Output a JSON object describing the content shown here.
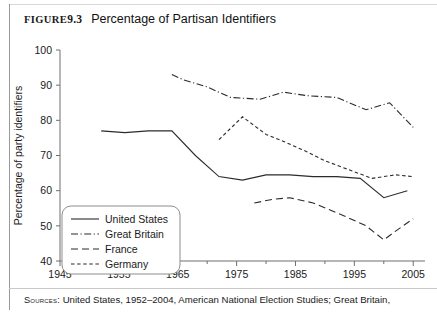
{
  "figure": {
    "label": "Figure",
    "number": "9.3",
    "caption": "Percentage of Partisan Identifiers"
  },
  "source": {
    "keyword": "Sources:",
    "text": "United States, 1952–2004, American National Election Studies; Great Britain,"
  },
  "chart_data": {
    "type": "line",
    "title": "Percentage of Partisan Identifiers",
    "xlabel": "",
    "ylabel": "Percentage of party identifiers",
    "xlim": [
      1945,
      2007
    ],
    "ylim": [
      40,
      100
    ],
    "xticks": [
      1945,
      1955,
      1965,
      1975,
      1985,
      1995,
      2005
    ],
    "xtick_labels": [
      "1945",
      "1955",
      "1965",
      "1975",
      "1985",
      "1995",
      "2005"
    ],
    "minor_xticks": [
      1950,
      1960,
      1970,
      1980,
      1990,
      2000
    ],
    "yticks": [
      40,
      50,
      60,
      70,
      80,
      90,
      100
    ],
    "ytick_labels": [
      "40",
      "50",
      "60",
      "70",
      "80",
      "90",
      "100"
    ],
    "grid": false,
    "legend_position": "lower-left",
    "series": [
      {
        "name": "United States",
        "dash": "none",
        "x": [
          1952,
          1956,
          1960,
          1964,
          1968,
          1972,
          1976,
          1980,
          1984,
          1988,
          1992,
          1996,
          2000,
          2004
        ],
        "y": [
          77.0,
          76.5,
          77.0,
          77.0,
          70.0,
          64.0,
          63.0,
          64.5,
          64.5,
          64.0,
          64.0,
          63.5,
          58.0,
          60.0
        ]
      },
      {
        "name": "Great Britain",
        "dash": "dashdot",
        "x": [
          1964,
          1966,
          1970,
          1974,
          1979,
          1983,
          1987,
          1992,
          1997,
          2001,
          2005
        ],
        "y": [
          93.0,
          91.5,
          89.5,
          86.5,
          86.0,
          88.0,
          87.0,
          86.5,
          83.0,
          85.0,
          78.0
        ]
      },
      {
        "name": "France",
        "dash": "longdash",
        "x": [
          1978,
          1981,
          1984,
          1988,
          1993,
          1997,
          2000,
          2002,
          2005
        ],
        "y": [
          56.5,
          57.5,
          58.0,
          56.5,
          53.0,
          50.0,
          46.0,
          48.5,
          52.0
        ]
      },
      {
        "name": "Germany",
        "dash": "shortdash",
        "x": [
          1972,
          1976,
          1980,
          1983,
          1987,
          1990,
          1994,
          1998,
          2002,
          2005
        ],
        "y": [
          74.5,
          81.0,
          76.0,
          74.0,
          71.0,
          68.5,
          66.0,
          63.5,
          64.5,
          64.0
        ]
      }
    ]
  }
}
